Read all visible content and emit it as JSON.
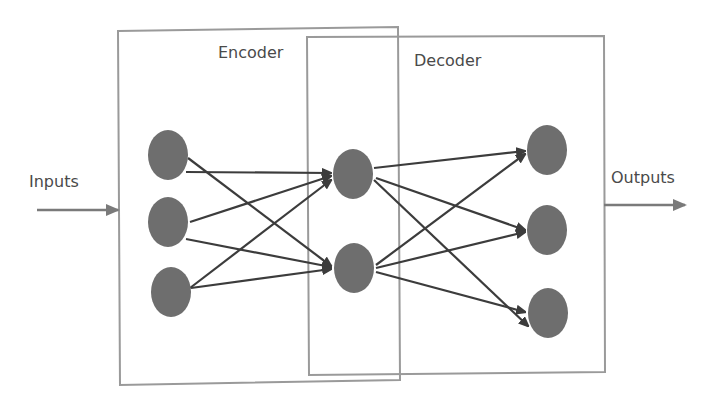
{
  "diagram": {
    "type": "autoencoder-neural-network",
    "labels": {
      "encoder": "Encoder",
      "decoder": "Decoder",
      "inputs": "Inputs",
      "outputs": "Outputs"
    },
    "colors": {
      "box_stroke": "#9a9a9a",
      "node_fill": "#6e6e6e",
      "edge_stroke": "#3c3c3c",
      "io_arrow": "#7a7a7a",
      "text": "#4a4a4a"
    },
    "layers": [
      {
        "name": "input",
        "nodes": 3
      },
      {
        "name": "hidden",
        "nodes": 2
      },
      {
        "name": "output",
        "nodes": 3
      }
    ],
    "connections": "fully-connected between adjacent layers"
  }
}
